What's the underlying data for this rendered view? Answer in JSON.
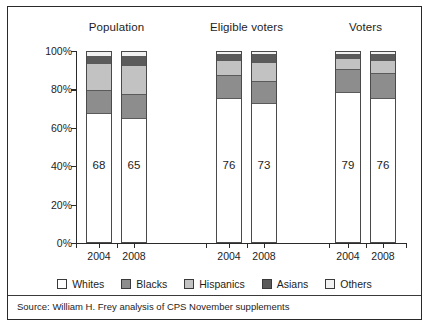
{
  "chart_data": {
    "type": "bar",
    "title": "",
    "subtitle": "",
    "xlabel": "",
    "ylabel": "",
    "ylim": [
      0,
      100
    ],
    "stacked": true,
    "normalized_percent": true,
    "grid": false,
    "legend_position": "bottom",
    "groups": [
      "Population",
      "Eligible voters",
      "Voters"
    ],
    "categories": [
      "2004",
      "2008",
      "2004",
      "2008",
      "2004",
      "2008"
    ],
    "y_ticks": [
      "0%",
      "20%",
      "40%",
      "60%",
      "80%",
      "100%"
    ],
    "y_tick_values": [
      0,
      20,
      40,
      60,
      80,
      100
    ],
    "series": [
      {
        "name": "Whites",
        "color": "#ffffff",
        "values": [
          68,
          65,
          76,
          73,
          79,
          76
        ]
      },
      {
        "name": "Blacks",
        "color": "#8d8d8d",
        "values": [
          12,
          13,
          12,
          12,
          12,
          13
        ]
      },
      {
        "name": "Hispanics",
        "color": "#c2c2c2",
        "values": [
          14,
          15,
          8,
          10,
          6,
          7
        ]
      },
      {
        "name": "Asians",
        "color": "#5b5b5b",
        "values": [
          4,
          5,
          3,
          4,
          2,
          3
        ]
      },
      {
        "name": "Others",
        "color": "#f2f2f2",
        "values": [
          2,
          2,
          1,
          1,
          1,
          1
        ]
      }
    ],
    "bar_value_labels": [
      "68",
      "65",
      "76",
      "73",
      "79",
      "76"
    ],
    "source": "Source: William H. Frey analysis of CPS November supplements"
  },
  "legend": {
    "items": [
      {
        "label": "Whites",
        "swatch_name": "legend-swatch-whites"
      },
      {
        "label": "Blacks",
        "swatch_name": "legend-swatch-blacks"
      },
      {
        "label": "Hispanics",
        "swatch_name": "legend-swatch-hispanics"
      },
      {
        "label": "Asians",
        "swatch_name": "legend-swatch-asians"
      },
      {
        "label": "Others",
        "swatch_name": "legend-swatch-others"
      }
    ]
  }
}
